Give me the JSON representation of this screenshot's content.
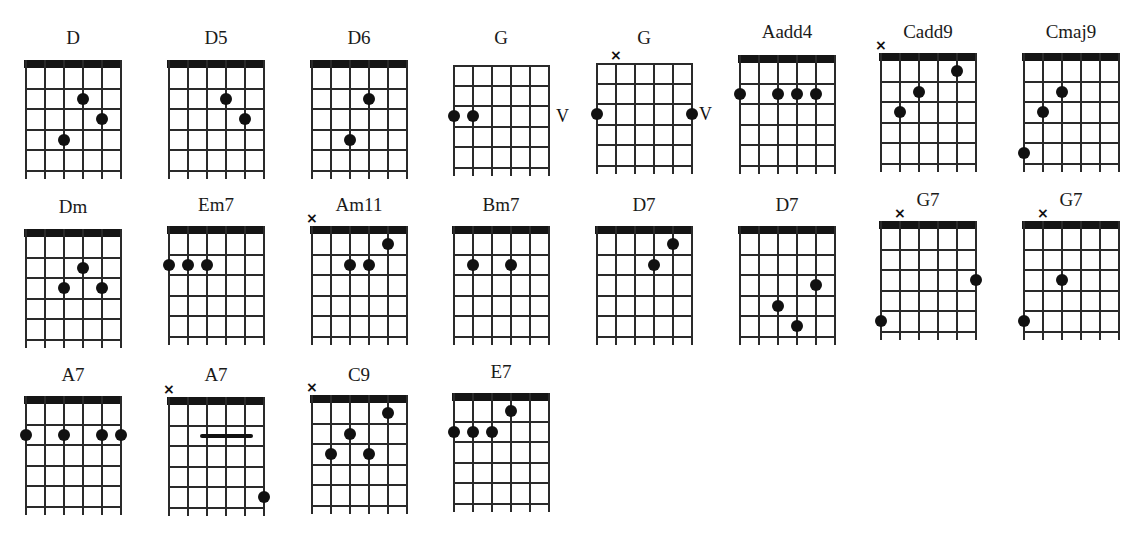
{
  "layout": {
    "string_spacing": 19,
    "fret_spacing": 20.5,
    "fret_spaces": 5
  },
  "chords": [
    {
      "name": "D",
      "x": 25,
      "y": 28,
      "grid_top": 32,
      "nut": true,
      "mute": [],
      "dots": [
        [
          4,
          2
        ],
        [
          5,
          3
        ],
        [
          3,
          4
        ]
      ],
      "bars": [],
      "position_label": ""
    },
    {
      "name": "D5",
      "x": 168,
      "y": 28,
      "grid_top": 32,
      "nut": true,
      "mute": [],
      "dots": [
        [
          4,
          2
        ],
        [
          5,
          3
        ]
      ],
      "bars": [],
      "position_label": ""
    },
    {
      "name": "D6",
      "x": 311,
      "y": 28,
      "grid_top": 32,
      "nut": true,
      "mute": [],
      "dots": [
        [
          4,
          2
        ],
        [
          3,
          4
        ]
      ],
      "bars": [],
      "position_label": ""
    },
    {
      "name": "G",
      "x": 453,
      "y": 28,
      "grid_top": 37,
      "nut": false,
      "mute": [],
      "dots": [
        [
          1,
          3
        ],
        [
          2,
          3
        ]
      ],
      "bars": [],
      "position_label": "V"
    },
    {
      "name": "G",
      "x": 596,
      "y": 28,
      "grid_top": 35,
      "nut": false,
      "mute": [
        2
      ],
      "dots": [
        [
          1,
          3
        ],
        [
          6,
          3
        ]
      ],
      "bars": [],
      "position_label": "V"
    },
    {
      "name": "Aadd4",
      "x": 739,
      "y": 22,
      "grid_top": 33,
      "nut": true,
      "mute": [],
      "dots": [
        [
          1,
          2
        ],
        [
          3,
          2
        ],
        [
          4,
          2
        ],
        [
          5,
          2
        ]
      ],
      "bars": [],
      "position_label": ""
    },
    {
      "name": "Cadd9",
      "x": 880,
      "y": 22,
      "grid_top": 31,
      "nut": true,
      "mute": [
        1
      ],
      "dots": [
        [
          5,
          1
        ],
        [
          3,
          2
        ],
        [
          2,
          3
        ]
      ],
      "bars": [],
      "position_label": ""
    },
    {
      "name": "Cmaj9",
      "x": 1023,
      "y": 22,
      "grid_top": 31,
      "nut": true,
      "mute": [],
      "dots": [
        [
          3,
          2
        ],
        [
          2,
          3
        ],
        [
          1,
          5
        ]
      ],
      "bars": [],
      "position_label": ""
    },
    {
      "name": "Dm",
      "x": 25,
      "y": 197,
      "grid_top": 32,
      "nut": true,
      "mute": [],
      "dots": [
        [
          4,
          2
        ],
        [
          3,
          3
        ],
        [
          5,
          3
        ]
      ],
      "bars": [],
      "position_label": ""
    },
    {
      "name": "Em7",
      "x": 168,
      "y": 195,
      "grid_top": 31,
      "nut": true,
      "mute": [],
      "dots": [
        [
          1,
          2
        ],
        [
          2,
          2
        ],
        [
          3,
          2
        ]
      ],
      "bars": [],
      "position_label": ""
    },
    {
      "name": "Am11",
      "x": 311,
      "y": 195,
      "grid_top": 31,
      "nut": true,
      "mute": [
        1
      ],
      "dots": [
        [
          5,
          1
        ],
        [
          3,
          2
        ],
        [
          4,
          2
        ]
      ],
      "bars": [],
      "position_label": ""
    },
    {
      "name": "Bm7",
      "x": 453,
      "y": 195,
      "grid_top": 31,
      "nut": true,
      "mute": [],
      "dots": [
        [
          2,
          2
        ],
        [
          4,
          2
        ]
      ],
      "bars": [],
      "position_label": ""
    },
    {
      "name": "D7",
      "x": 596,
      "y": 195,
      "grid_top": 31,
      "nut": true,
      "mute": [],
      "dots": [
        [
          5,
          1
        ],
        [
          4,
          2
        ]
      ],
      "bars": [],
      "position_label": ""
    },
    {
      "name": "D7",
      "x": 739,
      "y": 195,
      "grid_top": 31,
      "nut": true,
      "mute": [],
      "dots": [
        [
          5,
          3
        ],
        [
          3,
          4
        ],
        [
          4,
          5
        ]
      ],
      "bars": [],
      "position_label": ""
    },
    {
      "name": "G7",
      "x": 880,
      "y": 190,
      "grid_top": 31,
      "nut": true,
      "mute": [
        2
      ],
      "dots": [
        [
          6,
          3
        ],
        [
          1,
          5
        ]
      ],
      "bars": [],
      "position_label": ""
    },
    {
      "name": "G7",
      "x": 1023,
      "y": 190,
      "grid_top": 31,
      "nut": true,
      "mute": [
        2
      ],
      "dots": [
        [
          3,
          3
        ],
        [
          1,
          5
        ]
      ],
      "bars": [],
      "position_label": ""
    },
    {
      "name": "A7",
      "x": 25,
      "y": 365,
      "grid_top": 31,
      "nut": true,
      "mute": [],
      "dots": [
        [
          1,
          2
        ],
        [
          3,
          2
        ],
        [
          5,
          2
        ],
        [
          6,
          2
        ]
      ],
      "bars": [],
      "position_label": ""
    },
    {
      "name": "A7",
      "x": 168,
      "y": 365,
      "grid_top": 32,
      "nut": true,
      "mute": [
        1
      ],
      "dots": [
        [
          6,
          5
        ]
      ],
      "bars": [
        [
          2.7,
          5.5,
          2
        ]
      ],
      "position_label": ""
    },
    {
      "name": "C9",
      "x": 311,
      "y": 365,
      "grid_top": 30,
      "nut": true,
      "mute": [
        1
      ],
      "dots": [
        [
          5,
          1
        ],
        [
          3,
          2
        ],
        [
          2,
          3
        ],
        [
          4,
          3
        ]
      ],
      "bars": [],
      "position_label": ""
    },
    {
      "name": "E7",
      "x": 453,
      "y": 362,
      "grid_top": 31,
      "nut": true,
      "mute": [],
      "dots": [
        [
          4,
          1
        ],
        [
          1,
          2
        ],
        [
          2,
          2
        ],
        [
          3,
          2
        ]
      ],
      "bars": [],
      "position_label": ""
    }
  ]
}
